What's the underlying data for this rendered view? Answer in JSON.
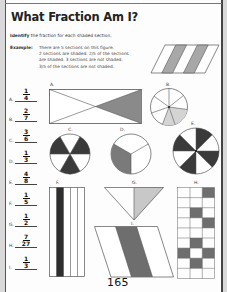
{
  "worksheet": {
    "title": "What Fraction Am I?",
    "instruction_bold": "Identify",
    "instruction_rest": " the fraction for each shaded section.",
    "example_label": "Example:",
    "example_lines": [
      "There are 5 sections on this figure.",
      "2 sections are shaded. 2/5 of the sections",
      "are shaded. 3 sections are not shaded.",
      "3/5 of the sections are not shaded."
    ],
    "page_number": "165"
  },
  "answers": [
    {
      "letter": "A.",
      "numerator": "1",
      "denominator": "4"
    },
    {
      "letter": "B.",
      "numerator": "2",
      "denominator": "7"
    },
    {
      "letter": "C.",
      "numerator": "3",
      "denominator": "6"
    },
    {
      "letter": "D.",
      "numerator": "1",
      "denominator": "3"
    },
    {
      "letter": "E.",
      "numerator": "4",
      "denominator": "8"
    },
    {
      "letter": "F.",
      "numerator": "1",
      "denominator": "5"
    },
    {
      "letter": "G.",
      "numerator": "1",
      "denominator": "2"
    },
    {
      "letter": "H.",
      "numerator": "7",
      "denominator": "27"
    },
    {
      "letter": "I.",
      "numerator": "1",
      "denominator": "3"
    }
  ],
  "shapes": {
    "A": {
      "label": "A.",
      "shape": "rectangle-x-diagonals",
      "sections": 4,
      "shaded": 1
    },
    "B": {
      "label": "B.",
      "shape": "circle",
      "sections": 7,
      "shaded": 2
    },
    "C": {
      "label": "C.",
      "shape": "circle",
      "sections": 6,
      "shaded": 3
    },
    "D": {
      "label": "D.",
      "shape": "circle",
      "sections": 3,
      "shaded": 1
    },
    "E": {
      "label": "E.",
      "shape": "circle",
      "sections": 8,
      "shaded": 4
    },
    "F": {
      "label": "F.",
      "shape": "rectangle-strips",
      "sections": 5,
      "shaded": 1
    },
    "G": {
      "label": "G.",
      "shape": "triangle",
      "sections": 2,
      "shaded": 1
    },
    "H": {
      "label": "H.",
      "shape": "grid",
      "sections": 27,
      "shaded": 7
    },
    "I": {
      "label": "I.",
      "shape": "parallelogram",
      "sections": 3,
      "shaded": 1
    }
  },
  "colors": {
    "dark_shade": "#3a3a3a",
    "mid_shade": "#7a7a7a",
    "light_shade": "#c4c4c4",
    "outline": "#555555"
  }
}
